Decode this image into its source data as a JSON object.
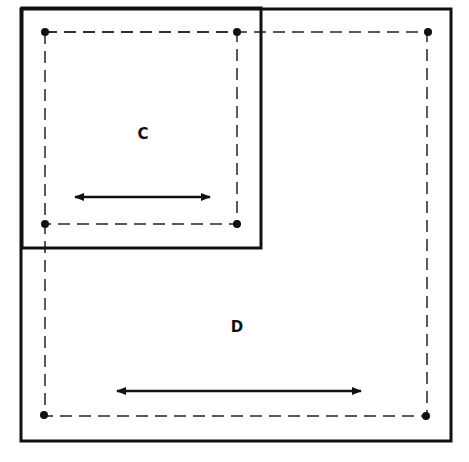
{
  "colors": {
    "ink": "#111111",
    "background": "#ffffff"
  },
  "diagram": {
    "outer_box_D": {
      "x1": 21,
      "y1": 9,
      "x2": 451,
      "y2": 441
    },
    "outer_box_C": {
      "x1": 22,
      "y1": 8,
      "x2": 261,
      "y2": 248
    },
    "dashed_C": {
      "x1": 45,
      "y1": 32,
      "x2": 237,
      "y2": 224
    },
    "dashed_D": {
      "x1": 45,
      "y1": 32,
      "x2": 427,
      "y2": 416
    },
    "labels": {
      "c": {
        "text": "C",
        "x": 143,
        "y": 139
      },
      "d": {
        "text": "D",
        "x": 237,
        "y": 332
      }
    },
    "arrows": {
      "c": {
        "x1": 73,
        "x2": 212,
        "y": 197
      },
      "d": {
        "x1": 115,
        "x2": 363,
        "y": 391
      }
    }
  }
}
